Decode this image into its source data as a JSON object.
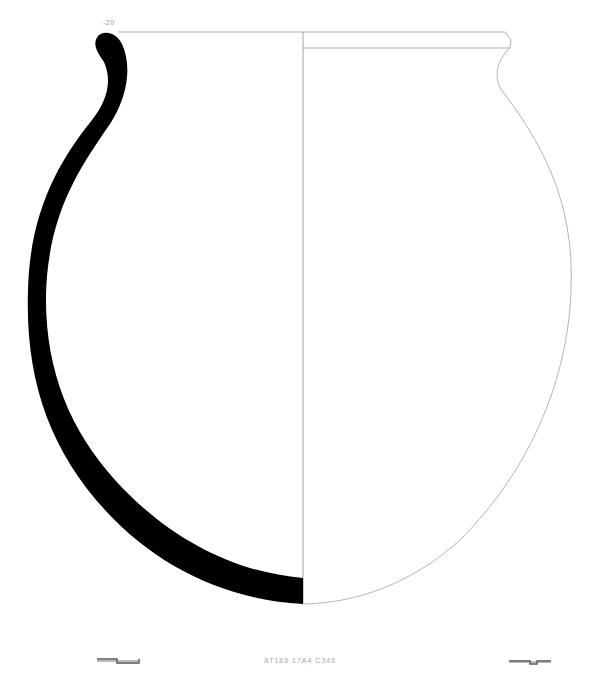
{
  "drawing": {
    "type": "pottery-profile",
    "rim_label": "-20",
    "catalog_label": "AT186 17A4 C346",
    "section_fill_color": "#000000",
    "outline_color": "#b5b5b5",
    "axis_color": "#a0a0a0",
    "scale_bar_color": "#555555"
  }
}
